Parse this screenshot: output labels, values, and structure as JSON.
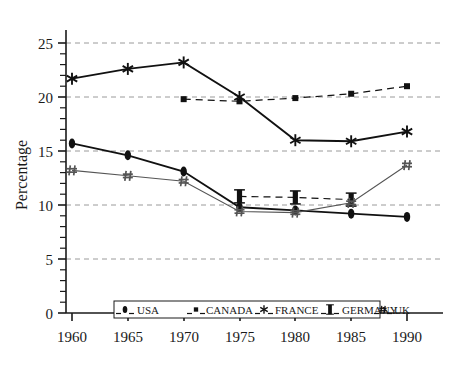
{
  "chart_data": {
    "type": "line",
    "title": "",
    "subtitle": "",
    "xlabel": "",
    "ylabel": "Percentage",
    "x": [
      1960,
      1965,
      1970,
      1975,
      1980,
      1985,
      1990
    ],
    "xtick_labels": [
      "1960",
      "1965",
      "1970",
      "1975",
      "1980",
      "1985",
      "1990"
    ],
    "ytick_labels": [
      "0",
      "5",
      "10",
      "15",
      "20",
      "25"
    ],
    "ytick_values": [
      0,
      5,
      10,
      15,
      20,
      25
    ],
    "xlim": [
      1960,
      1990
    ],
    "ylim": [
      0,
      25
    ],
    "grid": "horizontal-dashed",
    "minor_ticks_y": 1,
    "legend_position": "bottom-inside",
    "series": [
      {
        "name": "USA",
        "marker": "filled-ellipse",
        "line_style": "solid",
        "color": "#111111",
        "values": [
          15.7,
          14.6,
          13.1,
          9.8,
          9.5,
          9.2,
          8.9
        ]
      },
      {
        "name": "CANADA",
        "marker": "filled-square",
        "line_style": "dashed",
        "color": "#111111",
        "values": [
          null,
          null,
          19.8,
          19.6,
          19.9,
          20.3,
          21.0
        ]
      },
      {
        "name": "FRANCE",
        "marker": "asterisk",
        "line_style": "solid",
        "color": "#111111",
        "values": [
          21.7,
          22.6,
          23.2,
          20.0,
          16.0,
          15.9,
          16.8
        ]
      },
      {
        "name": "GERMANY",
        "marker": "capped-bar",
        "line_style": "dashed",
        "color": "#111111",
        "values": [
          null,
          null,
          null,
          10.8,
          10.7,
          10.5,
          null
        ]
      },
      {
        "name": "UK",
        "marker": "hash",
        "line_style": "solid-thin",
        "color": "#555555",
        "values": [
          13.2,
          12.7,
          12.2,
          9.4,
          9.3,
          10.2,
          13.7
        ]
      }
    ]
  },
  "axes": {
    "y_title": "Percentage",
    "y_ticks": [
      "25",
      "20",
      "15",
      "10",
      "5",
      "0"
    ],
    "x_ticks": [
      "1960",
      "1965",
      "1970",
      "1975",
      "1980",
      "1985",
      "1990"
    ]
  },
  "legend": {
    "entries": [
      {
        "label": "USA",
        "marker": "filled-ellipse"
      },
      {
        "label": "CANADA",
        "marker": "filled-square"
      },
      {
        "label": "FRANCE",
        "marker": "asterisk"
      },
      {
        "label": "GERMANY",
        "marker": "capped-bar"
      },
      {
        "label": "UK",
        "marker": "hash"
      }
    ]
  },
  "colors": {
    "ink": "#111111",
    "grid": "#9a9a9a",
    "uk_line": "#555555",
    "background": "#ffffff"
  }
}
